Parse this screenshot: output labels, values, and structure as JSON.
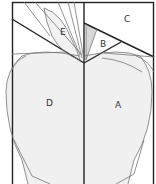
{
  "diagram": {
    "type": "quilt-block-pattern",
    "colors": {
      "background": "#ffffff",
      "apple_fill": "#f0f0f0",
      "leaf_fill": "#f2f2f2",
      "stem_shade": "#d8d8d8",
      "line_dark": "#222222",
      "line_light": "#777777"
    },
    "pieces": [
      {
        "id": "A",
        "label": "A",
        "description": "right apple body"
      },
      {
        "id": "B",
        "label": "B",
        "description": "small triangle right of stem"
      },
      {
        "id": "C",
        "label": "C",
        "description": "upper right background"
      },
      {
        "id": "D",
        "label": "D",
        "description": "left apple body"
      },
      {
        "id": "E",
        "label": "E",
        "description": "leaf"
      }
    ]
  }
}
